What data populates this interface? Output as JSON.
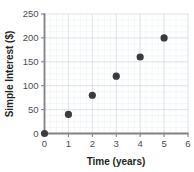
{
  "chart_data": {
    "type": "scatter",
    "title": "",
    "xlabel": "Time (years)",
    "ylabel": "Simple Interest ($)",
    "xlim": [
      0,
      6
    ],
    "ylim": [
      0,
      250
    ],
    "grid": true,
    "legend": "none",
    "x": [
      0,
      1,
      2,
      3,
      4,
      5
    ],
    "values": [
      0,
      40,
      80,
      120,
      160,
      200
    ],
    "points": [
      {
        "x": 0,
        "y": 0
      },
      {
        "x": 1,
        "y": 40
      },
      {
        "x": 2,
        "y": 80
      },
      {
        "x": 3,
        "y": 120
      },
      {
        "x": 4,
        "y": 160
      },
      {
        "x": 5,
        "y": 200
      }
    ],
    "xticks": [
      0,
      1,
      2,
      3,
      4,
      5,
      6
    ],
    "xtick_labels": [
      "0",
      "1",
      "2",
      "3",
      "4",
      "5",
      "6"
    ],
    "yticks": [
      0,
      50,
      100,
      150,
      200,
      250
    ],
    "ytick_labels": [
      "0",
      "50",
      "100",
      "150",
      "200",
      "250"
    ],
    "x_minor_step": 0.25,
    "y_minor_step": 12.5,
    "colors": {
      "point": "#3b3b3d",
      "axis": "#808285",
      "grid_major": "#d9dde2",
      "grid_minor": "#ebeef1",
      "title_text": "#231f20",
      "tick_text": "#4d4d4f",
      "background": "#ffffff"
    }
  }
}
